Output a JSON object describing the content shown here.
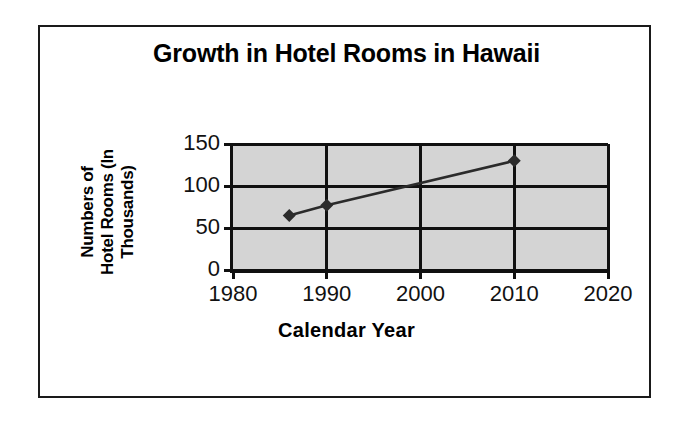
{
  "chart_data": {
    "type": "line",
    "title": "Growth in Hotel Rooms in Hawaii",
    "xlabel": "Calendar Year",
    "ylabel": "Numbers of Hotel Rooms (In Thousands)",
    "ylabel_lines": [
      "Numbers of",
      "Hotel Rooms (In",
      "Thousands)"
    ],
    "x": [
      1986,
      1990,
      2010
    ],
    "values": [
      65,
      77,
      130
    ],
    "series": [
      {
        "name": "Hotel Rooms",
        "points": [
          {
            "x": 1986,
            "y": 65
          },
          {
            "x": 1990,
            "y": 77
          },
          {
            "x": 2010,
            "y": 130
          }
        ]
      }
    ],
    "xlim": [
      1980,
      2020
    ],
    "ylim": [
      0,
      150
    ],
    "xticks": [
      1980,
      1990,
      2000,
      2010,
      2020
    ],
    "yticks": [
      0,
      50,
      100,
      150
    ],
    "xtick_labels": [
      "1980",
      "1990",
      "2000",
      "2010",
      "2020"
    ],
    "ytick_labels": [
      "0",
      "50",
      "100",
      "150"
    ],
    "grid": "both",
    "legend": "none",
    "marker": "diamond",
    "colors": {
      "plot_background": "#d4d4d4",
      "gridline": "#101010",
      "series_line": "#2b2b2b",
      "marker": "#2b2b2b",
      "text": "#000000",
      "frame_border": "#1a1a1a",
      "page_background": "#ffffff"
    }
  }
}
